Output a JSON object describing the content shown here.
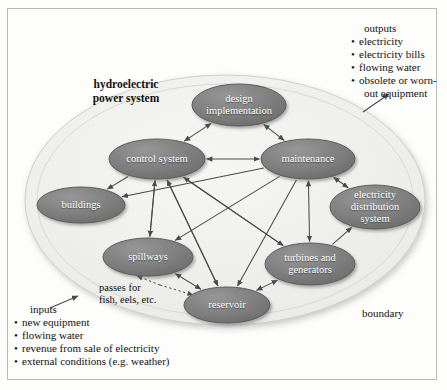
{
  "diagram": {
    "title": "hydroelectric power system",
    "boundary_label": "boundary",
    "colors": {
      "node_fill": "#7b7b7b",
      "node_fill_light": "#8e8e8e",
      "node_stroke": "#5d5d5d",
      "node_text": "#ffffff",
      "boundary_fill": "#f1f1ef",
      "boundary_stroke": "#cfcfcb",
      "arrow": "#4a4a4a",
      "page_bg": "#fdfdfc",
      "frame_stroke": "#b9b9b9",
      "text": "#111111"
    },
    "nodes": [
      {
        "id": "design",
        "label": "design\nimplementation",
        "cx": 239,
        "cy": 105,
        "rx": 47,
        "ry": 21
      },
      {
        "id": "control",
        "label": "control system",
        "cx": 157,
        "cy": 159,
        "rx": 48,
        "ry": 20
      },
      {
        "id": "maintenance",
        "label": "maintenance",
        "cx": 308,
        "cy": 159,
        "rx": 47,
        "ry": 20
      },
      {
        "id": "buildings",
        "label": "buildings",
        "cx": 81,
        "cy": 205,
        "rx": 44,
        "ry": 18
      },
      {
        "id": "distribution",
        "label": "electricity\ndistribution\nsystem",
        "cx": 375,
        "cy": 207,
        "rx": 45,
        "ry": 22
      },
      {
        "id": "spillways",
        "label": "spillways",
        "cx": 148,
        "cy": 257,
        "rx": 45,
        "ry": 19
      },
      {
        "id": "turbines",
        "label": "turbines and\ngenerators",
        "cx": 310,
        "cy": 264,
        "rx": 45,
        "ry": 21
      },
      {
        "id": "reservoir",
        "label": "reservoir",
        "cx": 227,
        "cy": 305,
        "rx": 43,
        "ry": 18
      }
    ],
    "edges": [
      {
        "from": "control",
        "to": "design",
        "dir": "both"
      },
      {
        "from": "design",
        "to": "maintenance",
        "dir": "both"
      },
      {
        "from": "control",
        "to": "maintenance",
        "dir": "both"
      },
      {
        "from": "control",
        "to": "buildings",
        "dir": "to"
      },
      {
        "from": "maintenance",
        "to": "buildings",
        "dir": "to"
      },
      {
        "from": "control",
        "to": "spillways",
        "dir": "to"
      },
      {
        "from": "control",
        "to": "reservoir",
        "dir": "to"
      },
      {
        "from": "control",
        "to": "turbines",
        "dir": "to"
      },
      {
        "from": "maintenance",
        "to": "spillways",
        "dir": "to"
      },
      {
        "from": "maintenance",
        "to": "reservoir",
        "dir": "to"
      },
      {
        "from": "maintenance",
        "to": "turbines",
        "dir": "both"
      },
      {
        "from": "maintenance",
        "to": "distribution",
        "dir": "both"
      },
      {
        "from": "turbines",
        "to": "distribution",
        "dir": "to"
      },
      {
        "from": "reservoir",
        "to": "turbines",
        "dir": "both"
      },
      {
        "from": "reservoir",
        "to": "spillways",
        "dir": "both"
      },
      {
        "from": "spillways",
        "to": "control",
        "dir": "to"
      },
      {
        "from": "turbines",
        "to": "control",
        "dir": "to"
      },
      {
        "from": "reservoir",
        "to": "control",
        "dir": "to"
      }
    ],
    "fish_pass": {
      "label_line1": "passes for",
      "label_line2": "fish, eels, etc.",
      "style": "dotted"
    },
    "inputs": {
      "heading": "inputs",
      "items": [
        "new equipment",
        "flowing water",
        "revenue from sale of electricity",
        "external conditions (e.g. weather)"
      ]
    },
    "outputs": {
      "heading": "outputs",
      "items": [
        "electricity",
        "electricity bills",
        "flowing water",
        "obsolete or worn-"
      ],
      "last_item_continuation": "out equipment"
    }
  }
}
